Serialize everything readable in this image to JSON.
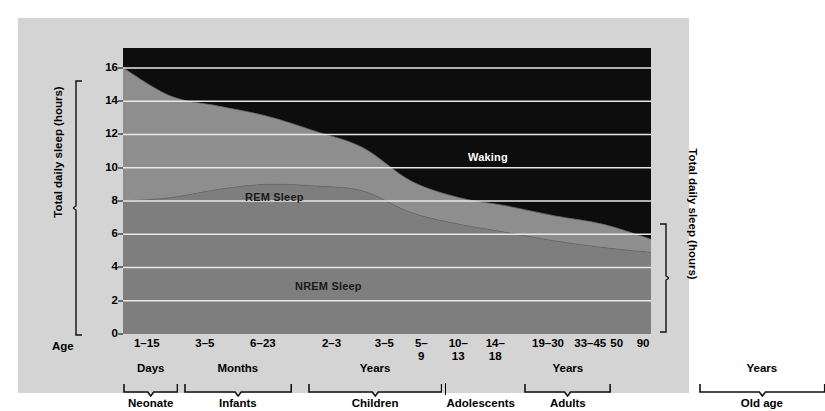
{
  "chart_data": {
    "type": "area",
    "title": "",
    "subtitle": "",
    "stacked": true,
    "ylabel": "Total daily sleep (hours)",
    "ylabel_right": "Total daily sleep (hours)",
    "xlabel": "Age",
    "ylim": [
      0,
      17.2
    ],
    "yticks": [
      0,
      2,
      4,
      6,
      8,
      10,
      12,
      14,
      16
    ],
    "ytick_labels": [
      "0",
      "2",
      "4",
      "6",
      "8",
      "10",
      "12",
      "14",
      "16"
    ],
    "grid": true,
    "grid_color": "#e8e8e8",
    "legend_position": "in-plot-annotations",
    "categories": [
      "1-15",
      "3-5",
      "6-23",
      "2-3",
      "3-5",
      "5-\n9",
      "10-\n13",
      "14-\n18",
      "19-30",
      "33-45",
      "50",
      "90"
    ],
    "x_positions_frac": [
      0.045,
      0.155,
      0.265,
      0.395,
      0.495,
      0.565,
      0.635,
      0.705,
      0.805,
      0.885,
      0.935,
      0.985
    ],
    "series": [
      {
        "name": "NREM Sleep",
        "color": "#7e7e7e",
        "values": [
          8.0,
          8.2,
          8.7,
          9.0,
          8.9,
          8.6,
          7.3,
          6.6,
          6.1,
          5.6,
          5.2,
          4.9
        ]
      },
      {
        "name": "REM Sleep",
        "color": "#8e8e8e",
        "values": [
          8.0,
          6.1,
          5.0,
          4.1,
          3.3,
          2.6,
          1.9,
          1.6,
          1.6,
          1.5,
          1.4,
          0.8
        ]
      },
      {
        "name": "Waking",
        "color": "#0d0d0d",
        "values": [
          1.0,
          2.7,
          3.3,
          3.9,
          4.8,
          5.8,
          7.8,
          8.8,
          9.3,
          10.1,
          10.6,
          11.5
        ]
      }
    ],
    "total_sleep_curve": [
      16.0,
      14.3,
      13.7,
      13.1,
      12.2,
      11.2,
      9.2,
      8.2,
      7.7,
      7.1,
      6.6,
      5.7
    ],
    "nrem_curve": [
      8.0,
      8.2,
      8.7,
      9.0,
      8.9,
      8.6,
      7.3,
      6.6,
      6.1,
      5.6,
      5.2,
      4.9
    ],
    "annotations": [
      {
        "text": "Waking",
        "color": "#ffffff"
      },
      {
        "text": "REM Sleep",
        "color": "#1a1a1a"
      },
      {
        "text": "NREM Sleep",
        "color": "#1a1a1a"
      }
    ],
    "age_groups": [
      {
        "unit": "Days",
        "name": "Neonate",
        "start_frac": 0.0,
        "end_frac": 0.105
      },
      {
        "unit": "Months",
        "name": "Infants",
        "start_frac": 0.115,
        "end_frac": 0.32
      },
      {
        "unit": "Years",
        "name": "Children",
        "start_frac": 0.35,
        "end_frac": 0.605
      },
      {
        "unit": "",
        "name": "Adolescents",
        "start_frac": 0.61,
        "end_frac": 0.745
      },
      {
        "unit": "Years",
        "name": "Adults",
        "start_frac": 0.76,
        "end_frac": 0.925
      },
      {
        "unit": "Years",
        "name": "Old age",
        "start_frac": 1.09,
        "end_frac": 1.33
      }
    ],
    "range_connector": {
      "from_label": "50",
      "to_label": "90"
    }
  },
  "axes": {
    "y_title": "Total daily sleep (hours)",
    "y_title_right": "Total daily sleep (hours)",
    "x_title": "Age",
    "yticks": [
      "0",
      "2",
      "4",
      "6",
      "8",
      "10",
      "12",
      "14",
      "16"
    ]
  },
  "xticks": [
    {
      "label": "1–15"
    },
    {
      "label": "3–5"
    },
    {
      "label": "6–23"
    },
    {
      "label": "2–3"
    },
    {
      "label": "3–5"
    },
    {
      "label": "5–\n9"
    },
    {
      "label": "10–\n13"
    },
    {
      "label": "14–\n18"
    },
    {
      "label": "19–30"
    },
    {
      "label": "33–45"
    },
    {
      "label": "50"
    },
    {
      "label": "90"
    }
  ],
  "groups": [
    {
      "unit": "Days",
      "name": "Neonate"
    },
    {
      "unit": "Months",
      "name": "Infants"
    },
    {
      "unit": "Years",
      "name": "Children"
    },
    {
      "unit": "",
      "name": "Adolescents"
    },
    {
      "unit": "Years",
      "name": "Adults"
    },
    {
      "unit": "Years",
      "name": "Old age"
    }
  ],
  "series_labels": {
    "waking": "Waking",
    "rem": "REM Sleep",
    "nrem": "NREM Sleep"
  },
  "colors": {
    "waking": "#0d0d0d",
    "rem": "#8e8e8e",
    "nrem": "#7e7e7e",
    "panel_bg": "#d4d4d4",
    "page_bg": "#ffffff",
    "grid": "#e8e8e8"
  }
}
